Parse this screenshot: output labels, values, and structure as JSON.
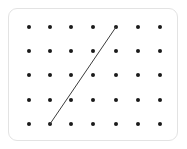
{
  "canvas": {
    "width": 187,
    "height": 149,
    "background_color": "#ffffff"
  },
  "card": {
    "x": 8,
    "y": 8,
    "width": 170,
    "height": 133,
    "fill_color": "#ffffff",
    "border_color": "#e3e3e3",
    "corner_radius": 9
  },
  "chart_data": {
    "type": "scatter",
    "title": "",
    "subtitle": "",
    "xlabel": "",
    "ylabel": "",
    "grid": false,
    "legend": null,
    "lattice": {
      "columns": 7,
      "rows": 5,
      "dot_count": 35,
      "dot_color": "#1a1a1a",
      "dot_diameter": 4,
      "column_x": [
        29,
        50,
        71,
        93,
        116,
        138,
        160
      ],
      "row_y": [
        27,
        51,
        75,
        100,
        124
      ]
    },
    "points": [
      {
        "col": 1,
        "row": 1,
        "x": 29,
        "y": 27
      },
      {
        "col": 2,
        "row": 1,
        "x": 50,
        "y": 27
      },
      {
        "col": 3,
        "row": 1,
        "x": 71,
        "y": 27
      },
      {
        "col": 4,
        "row": 1,
        "x": 93,
        "y": 27
      },
      {
        "col": 5,
        "row": 1,
        "x": 116,
        "y": 27
      },
      {
        "col": 6,
        "row": 1,
        "x": 138,
        "y": 27
      },
      {
        "col": 7,
        "row": 1,
        "x": 160,
        "y": 27
      },
      {
        "col": 1,
        "row": 2,
        "x": 29,
        "y": 51
      },
      {
        "col": 2,
        "row": 2,
        "x": 50,
        "y": 51
      },
      {
        "col": 3,
        "row": 2,
        "x": 71,
        "y": 51
      },
      {
        "col": 4,
        "row": 2,
        "x": 93,
        "y": 51
      },
      {
        "col": 5,
        "row": 2,
        "x": 116,
        "y": 51
      },
      {
        "col": 6,
        "row": 2,
        "x": 138,
        "y": 51
      },
      {
        "col": 7,
        "row": 2,
        "x": 160,
        "y": 51
      },
      {
        "col": 1,
        "row": 3,
        "x": 29,
        "y": 75
      },
      {
        "col": 2,
        "row": 3,
        "x": 50,
        "y": 75
      },
      {
        "col": 3,
        "row": 3,
        "x": 71,
        "y": 75
      },
      {
        "col": 4,
        "row": 3,
        "x": 93,
        "y": 75
      },
      {
        "col": 5,
        "row": 3,
        "x": 116,
        "y": 75
      },
      {
        "col": 6,
        "row": 3,
        "x": 138,
        "y": 75
      },
      {
        "col": 7,
        "row": 3,
        "x": 160,
        "y": 75
      },
      {
        "col": 1,
        "row": 4,
        "x": 29,
        "y": 100
      },
      {
        "col": 2,
        "row": 4,
        "x": 50,
        "y": 100
      },
      {
        "col": 3,
        "row": 4,
        "x": 71,
        "y": 100
      },
      {
        "col": 4,
        "row": 4,
        "x": 93,
        "y": 100
      },
      {
        "col": 5,
        "row": 4,
        "x": 116,
        "y": 100
      },
      {
        "col": 6,
        "row": 4,
        "x": 138,
        "y": 100
      },
      {
        "col": 7,
        "row": 4,
        "x": 160,
        "y": 100
      },
      {
        "col": 1,
        "row": 5,
        "x": 29,
        "y": 124
      },
      {
        "col": 2,
        "row": 5,
        "x": 50,
        "y": 124
      },
      {
        "col": 3,
        "row": 5,
        "x": 71,
        "y": 124
      },
      {
        "col": 4,
        "row": 5,
        "x": 93,
        "y": 124
      },
      {
        "col": 5,
        "row": 5,
        "x": 116,
        "y": 124
      },
      {
        "col": 6,
        "row": 5,
        "x": 138,
        "y": 124
      },
      {
        "col": 7,
        "row": 5,
        "x": 160,
        "y": 124
      }
    ],
    "segments": [
      {
        "name": "line-segment",
        "from": {
          "col": 2,
          "row": 5,
          "x": 50,
          "y": 124
        },
        "to": {
          "col": 5,
          "row": 1,
          "x": 116,
          "y": 27
        },
        "color": "#3c3c3c",
        "width": 1
      }
    ]
  }
}
